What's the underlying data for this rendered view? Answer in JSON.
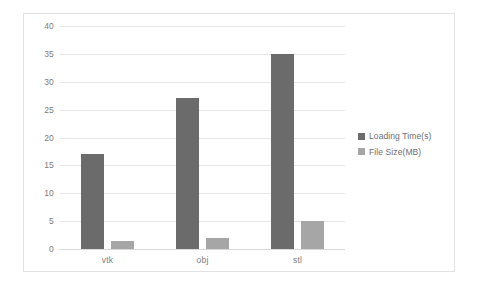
{
  "chart_data": {
    "type": "bar",
    "title": "",
    "xlabel": "",
    "ylabel": "",
    "categories": [
      "vtk",
      "obj",
      "stl"
    ],
    "series": [
      {
        "name": "Loading Time(s)",
        "color": "#6b6b6b",
        "values": [
          17,
          27,
          35
        ]
      },
      {
        "name": "File Size(MB)",
        "color": "#a6a6a6",
        "values": [
          1.4,
          2,
          5
        ]
      }
    ],
    "ylim": [
      0,
      40
    ],
    "yticks": [
      0,
      5,
      10,
      15,
      20,
      25,
      30,
      35,
      40
    ],
    "ytick_labels": [
      "0",
      "5",
      "10",
      "15",
      "20",
      "25",
      "30",
      "35",
      "40"
    ],
    "grid": true,
    "legend_position": "right"
  },
  "legend": {
    "items": [
      {
        "label": "Loading Time(s)",
        "marker": "square-swatch"
      },
      {
        "label": "File Size(MB)",
        "marker": "square-swatch"
      }
    ]
  }
}
